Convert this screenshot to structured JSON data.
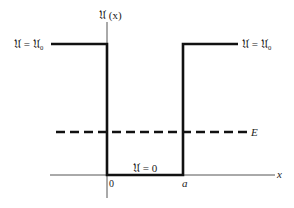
{
  "diagram": {
    "y_axis_label": "𝔘 (x)",
    "x_axis_label": "x",
    "left_barrier_label": "𝔘 = 𝔘₀",
    "right_barrier_label": "𝔘 = 𝔘₀",
    "well_floor_label": "𝔘 = 0",
    "origin_label": "0",
    "well_edge_label": "a",
    "energy_label": "E",
    "colors": {
      "potential_line": "#111111",
      "axis_line": "#555555",
      "energy_line": "#111111",
      "background": "#ffffff"
    },
    "potential": {
      "well_start_x": "0",
      "well_end_x": "a",
      "barrier_value": "𝔘₀",
      "well_value": "0",
      "energy_level": "E (between 0 and 𝔘₀)"
    }
  }
}
